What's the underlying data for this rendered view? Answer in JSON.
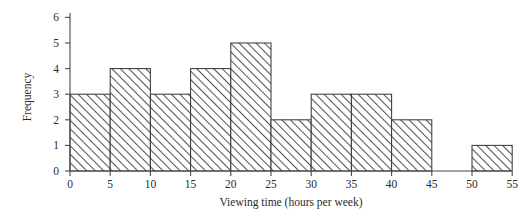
{
  "chart_data": {
    "type": "bar",
    "title": "",
    "subtitle": "",
    "xlabel": "Viewing time (hours per week)",
    "ylabel": "Frequency",
    "bin_width": 5,
    "bin_edges": [
      0,
      5,
      10,
      15,
      20,
      25,
      30,
      35,
      40,
      45,
      50,
      55
    ],
    "categories": [
      "0-5",
      "5-10",
      "10-15",
      "15-20",
      "20-25",
      "25-30",
      "30-35",
      "35-40",
      "40-45",
      "45-50",
      "50-55"
    ],
    "values": [
      3,
      4,
      3,
      4,
      5,
      2,
      3,
      3,
      2,
      0,
      1
    ],
    "xticks": [
      0,
      5,
      10,
      15,
      20,
      25,
      30,
      35,
      40,
      45,
      50,
      55
    ],
    "yticks": [
      0,
      1,
      2,
      3,
      4,
      5,
      6
    ],
    "xlim": [
      0,
      55
    ],
    "ylim": [
      0,
      6
    ],
    "grid": false,
    "legend": null,
    "legend_position": "none",
    "bar_fill": "hatch-diagonal",
    "bar_edge_color": "#3b3b3b",
    "axis_color": "#4a4a4a",
    "background_color": "#ffffff",
    "annotations": []
  },
  "axes": {
    "y_title": "Frequency",
    "x_title": "Viewing time (hours per week)"
  },
  "ticks": {
    "y": [
      "0",
      "1",
      "2",
      "3",
      "4",
      "5",
      "6"
    ],
    "x": [
      "0",
      "5",
      "10",
      "15",
      "20",
      "25",
      "30",
      "35",
      "40",
      "45",
      "50",
      "55"
    ]
  }
}
